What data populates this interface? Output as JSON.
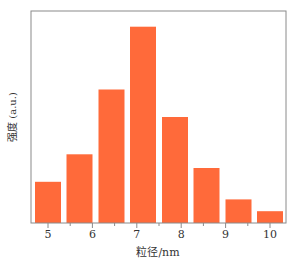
{
  "chart_data": {
    "type": "bar",
    "title": "",
    "xlabel": "粒径/nm",
    "ylabel": "强度 (a.u.)",
    "x_tick_labels": [
      "5",
      "6",
      "7",
      "8",
      "9",
      "10"
    ],
    "x_ticks": [
      5,
      6,
      7,
      8,
      9,
      10
    ],
    "xlim": [
      4.6,
      10.4
    ],
    "categories": [
      "5.0",
      "5.7",
      "6.4",
      "7.1",
      "7.9",
      "8.6",
      "9.3",
      "10.0"
    ],
    "x": [
      5.0,
      5.71,
      6.43,
      7.14,
      7.86,
      8.57,
      9.29,
      10.0
    ],
    "values": [
      0.21,
      0.35,
      0.68,
      1.0,
      0.54,
      0.28,
      0.12,
      0.06
    ],
    "ylim": [
      0,
      1.08
    ],
    "y_ticks_shown": false,
    "grid": false,
    "legend": null,
    "bar_color": "#FF6A3A"
  },
  "colors": {
    "bar": "#FF6A3A",
    "axis": "#7a7a7a",
    "text": "#333333"
  }
}
